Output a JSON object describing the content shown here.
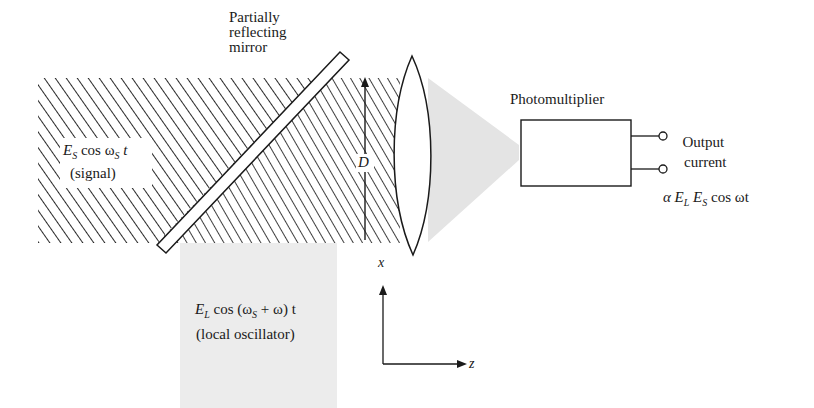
{
  "diagram": {
    "mirror_label": [
      "Partially",
      "reflecting",
      "mirror"
    ],
    "signal": {
      "field_symbol": "E",
      "field_sub": "S",
      "expr_mid": "cos ω",
      "expr_sub": "S",
      "expr_end": "t",
      "caption": "(signal)"
    },
    "local_oscillator": {
      "field_symbol": "E",
      "field_sub": "L",
      "expr_mid": "cos (ω",
      "expr_sub": "S",
      "expr_end": "+ ω) t",
      "caption": "(local oscillator)"
    },
    "beam_diameter_label": "D",
    "detector_label": "Photomultiplier",
    "output_label": [
      "Output",
      "current"
    ],
    "output_expr": {
      "prefix": "α E",
      "sub1": "L",
      "mid": " E",
      "sub2": "S",
      "end": "cos ωt"
    },
    "axes": {
      "vertical_label": "x",
      "horizontal_label": "z"
    },
    "colors": {
      "ink": "#1a1a1a",
      "hatch": "#2a2a2a",
      "beam_gray": "#ececec",
      "cone_gray": "#e4e4e4",
      "background": "#ffffff"
    }
  }
}
